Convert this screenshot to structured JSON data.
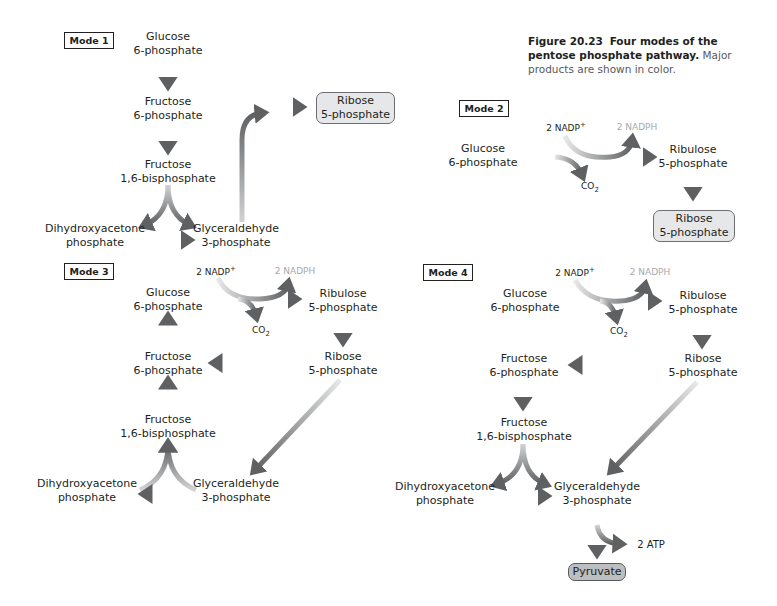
{
  "caption": {
    "figure_number": "Figure 20.23",
    "title": "Four modes of the pentose phosphate pathway.",
    "text": "Major products are shown in color."
  },
  "colors": {
    "arrow_dark": "#5f6062",
    "arrow_light": "#e6e7e8",
    "product_box": "#e6e7e8",
    "pyruvate_box": "#bcbec0",
    "nadph_text": "#a7a9ac"
  },
  "mode1": {
    "label": "Mode 1",
    "glucose6p": [
      "Glucose",
      "6-phosphate"
    ],
    "fructose6p": [
      "Fructose",
      "6-phosphate"
    ],
    "fructose16bp": [
      "Fructose",
      "1,6-bisphosphate"
    ],
    "dhap": [
      "Dihydroxyacetone",
      "phosphate"
    ],
    "g3p": [
      "Glyceraldehyde",
      "3-phosphate"
    ],
    "ribose5p": [
      "Ribose",
      "5-phosphate"
    ]
  },
  "mode2": {
    "label": "Mode 2",
    "nadp": "2 NADP",
    "nadp_sup": "+",
    "nadph": "2 NADPH",
    "glucose6p": [
      "Glucose",
      "6-phosphate"
    ],
    "ribulose5p": [
      "Ribulose",
      "5-phosphate"
    ],
    "co2": "CO",
    "co2_sub": "2",
    "ribose5p": [
      "Ribose",
      "5-phosphate"
    ]
  },
  "mode3": {
    "label": "Mode 3",
    "nadp": "2 NADP",
    "nadp_sup": "+",
    "nadph": "2 NADPH",
    "glucose6p": [
      "Glucose",
      "6-phosphate"
    ],
    "ribulose5p": [
      "Ribulose",
      "5-phosphate"
    ],
    "co2": "CO",
    "co2_sub": "2",
    "fructose6p": [
      "Fructose",
      "6-phosphate"
    ],
    "ribose5p": [
      "Ribose",
      "5-phosphate"
    ],
    "fructose16bp": [
      "Fructose",
      "1,6-bisphosphate"
    ],
    "dhap": [
      "Dihydroxyacetone",
      "phosphate"
    ],
    "g3p": [
      "Glyceraldehyde",
      "3-phosphate"
    ]
  },
  "mode4": {
    "label": "Mode 4",
    "nadp": "2 NADP",
    "nadp_sup": "+",
    "nadph": "2 NADPH",
    "glucose6p": [
      "Glucose",
      "6-phosphate"
    ],
    "ribulose5p": [
      "Ribulose",
      "5-phosphate"
    ],
    "co2": "CO",
    "co2_sub": "2",
    "fructose6p": [
      "Fructose",
      "6-phosphate"
    ],
    "ribose5p": [
      "Ribose",
      "5-phosphate"
    ],
    "fructose16bp": [
      "Fructose",
      "1,6-bisphosphate"
    ],
    "dhap": [
      "Dihydroxyacetone",
      "phosphate"
    ],
    "g3p": [
      "Glyceraldehyde",
      "3-phosphate"
    ],
    "atp": "2 ATP",
    "pyruvate": "Pyruvate"
  }
}
